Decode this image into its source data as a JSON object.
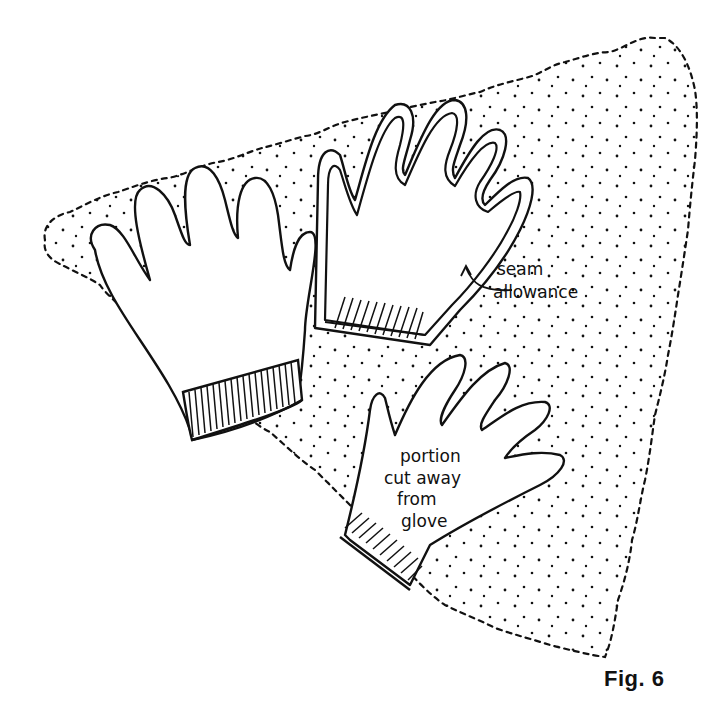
{
  "figure": {
    "caption": "Fig. 6",
    "annotations": {
      "seam_allowance": [
        "seam",
        "allowance"
      ],
      "cut_away": [
        "portion",
        "cut away",
        "from",
        "glove"
      ]
    },
    "elements": {
      "fabric": "dotted triangular fabric piece with scalloped edge",
      "left_glove": "whole knit glove with ribbed cuff",
      "middle_glove": "glove outline traced with seam allowance",
      "bottom_glove": "portion cut away from glove"
    },
    "colors": {
      "ink": "#111111",
      "background": "#ffffff"
    }
  }
}
